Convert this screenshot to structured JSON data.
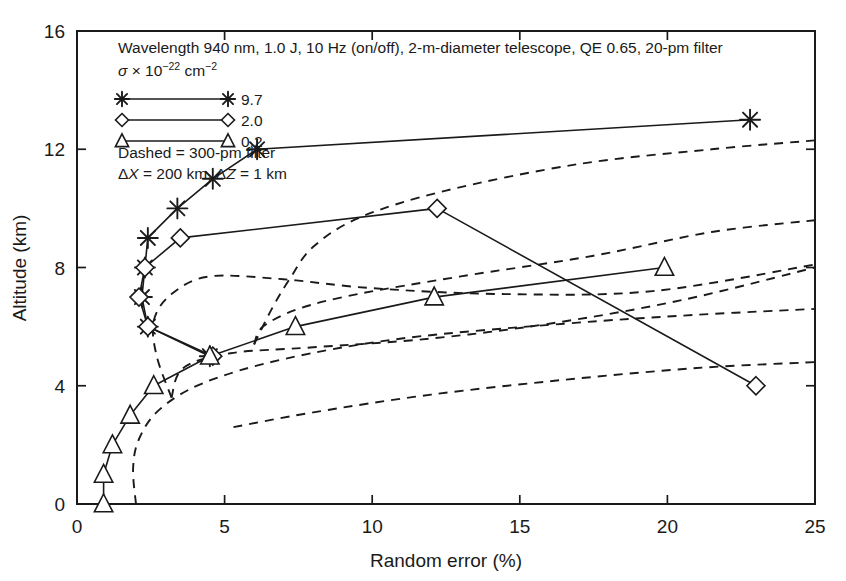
{
  "chart_data": {
    "type": "line",
    "title": "",
    "xlabel": "Random error (%)",
    "ylabel": "Altitude (km)",
    "xlim": [
      0,
      25
    ],
    "ylim": [
      0,
      16
    ],
    "xticks": [
      0,
      5,
      10,
      15,
      20,
      25
    ],
    "yticks": [
      0,
      4,
      8,
      12,
      16
    ],
    "grid": false,
    "legend_position": "upper-left-inset",
    "annotations": [
      "Wavelength 940 nm, 1.0 J, 10 Hz (on/off), 2-m-diameter telescope, QE 0.65, 20-pm filter",
      "Dashed = 300-pm filter"
    ],
    "sigma_label_prefix": "σ × 10",
    "sigma_label_exp": "−22",
    "sigma_label_unit": " cm",
    "sigma_label_unit_exp": "−2",
    "delta_label_x": "ΔX",
    "delta_label_x_val": " = 200 km, ",
    "delta_label_z": "ΔZ",
    "delta_label_z_val": " = 1 km",
    "legend_entries": [
      {
        "label": "9.7",
        "marker": "asterisk",
        "style": "solid"
      },
      {
        "label": "2.0",
        "marker": "diamond",
        "style": "solid"
      },
      {
        "label": "0.2",
        "marker": "triangle",
        "style": "solid"
      }
    ],
    "series": [
      {
        "name": "9.7",
        "marker": "asterisk",
        "style": "solid",
        "filter": "20-pm",
        "points": [
          {
            "x": 4.5,
            "y": 5
          },
          {
            "x": 2.4,
            "y": 6
          },
          {
            "x": 2.2,
            "y": 7
          },
          {
            "x": 2.3,
            "y": 8
          },
          {
            "x": 2.4,
            "y": 9
          },
          {
            "x": 3.4,
            "y": 10
          },
          {
            "x": 4.6,
            "y": 11
          },
          {
            "x": 6.1,
            "y": 12
          },
          {
            "x": 22.8,
            "y": 13
          }
        ]
      },
      {
        "name": "2.0",
        "marker": "diamond",
        "style": "solid",
        "filter": "20-pm",
        "points": [
          {
            "x": 4.6,
            "y": 5
          },
          {
            "x": 2.4,
            "y": 6
          },
          {
            "x": 2.1,
            "y": 7
          },
          {
            "x": 2.3,
            "y": 8
          },
          {
            "x": 3.5,
            "y": 9
          },
          {
            "x": 12.2,
            "y": 10
          },
          {
            "x": 23.0,
            "y": 4
          }
        ]
      },
      {
        "name": "0.2",
        "marker": "triangle",
        "style": "solid",
        "filter": "20-pm",
        "points": [
          {
            "x": 0.9,
            "y": 0
          },
          {
            "x": 0.9,
            "y": 1
          },
          {
            "x": 1.2,
            "y": 2
          },
          {
            "x": 1.8,
            "y": 3
          },
          {
            "x": 2.6,
            "y": 4
          },
          {
            "x": 4.5,
            "y": 5
          },
          {
            "x": 7.4,
            "y": 6
          },
          {
            "x": 12.1,
            "y": 7
          },
          {
            "x": 19.9,
            "y": 8
          }
        ]
      }
    ],
    "dashed_curves": [
      {
        "name": "9.7-300pm",
        "style": "dashed",
        "filter": "300-pm",
        "points": [
          {
            "x": 6.0,
            "y": 5.4
          },
          {
            "x": 6.6,
            "y": 6.6
          },
          {
            "x": 7.2,
            "y": 7.6
          },
          {
            "x": 8.0,
            "y": 8.7
          },
          {
            "x": 9.6,
            "y": 9.7
          },
          {
            "x": 12.5,
            "y": 10.6
          },
          {
            "x": 17.0,
            "y": 11.5
          },
          {
            "x": 21.5,
            "y": 12.0
          },
          {
            "x": 25.0,
            "y": 12.3
          }
        ]
      },
      {
        "name": "9.7-300pm-lower",
        "style": "dashed",
        "filter": "300-pm",
        "points": [
          {
            "x": 6.0,
            "y": 5.4
          },
          {
            "x": 6.3,
            "y": 6.0
          },
          {
            "x": 7.5,
            "y": 6.6
          },
          {
            "x": 9.5,
            "y": 7.1
          },
          {
            "x": 13.0,
            "y": 7.7
          },
          {
            "x": 17.5,
            "y": 8.4
          },
          {
            "x": 21.5,
            "y": 9.2
          },
          {
            "x": 25.0,
            "y": 9.6
          }
        ]
      },
      {
        "name": "2.0-300pm",
        "style": "dashed",
        "filter": "300-pm",
        "points": [
          {
            "x": 3.2,
            "y": 3.6
          },
          {
            "x": 2.7,
            "y": 5.0
          },
          {
            "x": 2.6,
            "y": 6.2
          },
          {
            "x": 3.2,
            "y": 7.1
          },
          {
            "x": 4.5,
            "y": 7.7
          },
          {
            "x": 7.0,
            "y": 7.6
          },
          {
            "x": 10.0,
            "y": 7.3
          },
          {
            "x": 14.5,
            "y": 7.1
          },
          {
            "x": 19.5,
            "y": 7.2
          },
          {
            "x": 25.0,
            "y": 8.1
          }
        ]
      },
      {
        "name": "2.0-300pm-lower",
        "style": "dashed",
        "filter": "300-pm",
        "points": [
          {
            "x": 3.2,
            "y": 3.6
          },
          {
            "x": 3.6,
            "y": 4.6
          },
          {
            "x": 5.2,
            "y": 5.1
          },
          {
            "x": 8.0,
            "y": 5.3
          },
          {
            "x": 12.0,
            "y": 5.6
          },
          {
            "x": 16.0,
            "y": 6.1
          },
          {
            "x": 20.5,
            "y": 6.9
          },
          {
            "x": 25.0,
            "y": 8.0
          }
        ]
      },
      {
        "name": "0.2-300pm",
        "style": "dashed",
        "filter": "300-pm",
        "points": [
          {
            "x": 2.0,
            "y": 0.0
          },
          {
            "x": 1.9,
            "y": 1.2
          },
          {
            "x": 2.1,
            "y": 2.2
          },
          {
            "x": 2.8,
            "y": 3.2
          },
          {
            "x": 4.3,
            "y": 4.1
          },
          {
            "x": 7.0,
            "y": 4.9
          },
          {
            "x": 11.0,
            "y": 5.6
          },
          {
            "x": 16.5,
            "y": 6.1
          },
          {
            "x": 21.0,
            "y": 6.4
          },
          {
            "x": 25.0,
            "y": 6.6
          }
        ]
      },
      {
        "name": "0.2-300pm-lower",
        "style": "dashed",
        "filter": "300-pm",
        "points": [
          {
            "x": 5.3,
            "y": 2.6
          },
          {
            "x": 8.0,
            "y": 3.1
          },
          {
            "x": 12.0,
            "y": 3.7
          },
          {
            "x": 16.5,
            "y": 4.2
          },
          {
            "x": 21.0,
            "y": 4.6
          },
          {
            "x": 25.0,
            "y": 4.8
          }
        ]
      }
    ]
  }
}
